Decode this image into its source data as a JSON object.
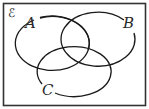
{
  "diagram": {
    "type": "venn",
    "universal_label": "ℰ",
    "sets": [
      {
        "name": "A",
        "label": "A"
      },
      {
        "name": "B",
        "label": "B"
      },
      {
        "name": "C",
        "label": "C"
      }
    ],
    "stroke_color": "#1a1a1a",
    "border_color": "#333333"
  }
}
